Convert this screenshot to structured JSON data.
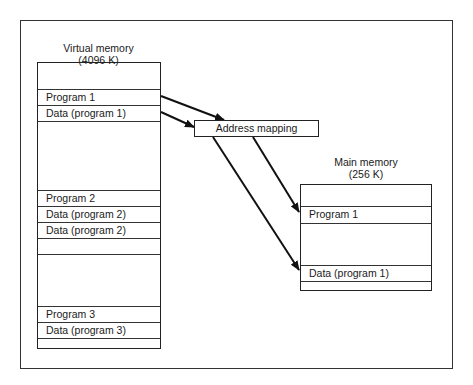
{
  "virtual_memory": {
    "title": "Virtual memory",
    "size": "(4096 K)",
    "rows": [
      {
        "top": 26,
        "height": 16,
        "label": "Program 1"
      },
      {
        "top": 42,
        "height": 16,
        "label": "Data (program 1)"
      },
      {
        "top": 58,
        "height": 15,
        "label": ""
      },
      {
        "top": 127,
        "height": 16,
        "label": "Program 2"
      },
      {
        "top": 143,
        "height": 16,
        "label": "Data (program 2)"
      },
      {
        "top": 159,
        "height": 16,
        "label": "Data (program 2)"
      },
      {
        "top": 175,
        "height": 16,
        "label": ""
      },
      {
        "top": 191,
        "height": 16,
        "label": ""
      },
      {
        "top": 243,
        "height": 16,
        "label": "Program 3"
      },
      {
        "top": 259,
        "height": 16,
        "label": "Data (program 3)"
      },
      {
        "top": 275,
        "height": 11,
        "label": ""
      }
    ]
  },
  "address_mapping": {
    "label": "Address mapping"
  },
  "main_memory": {
    "title": "Main memory",
    "size": "(256 K)",
    "rows": [
      {
        "top": 21,
        "height": 17,
        "label": "Program 1"
      },
      {
        "top": 38,
        "height": 42,
        "label": ""
      },
      {
        "top": 80,
        "height": 16,
        "label": "Data (program 1)"
      },
      {
        "top": 96,
        "height": 10,
        "label": ""
      }
    ]
  }
}
